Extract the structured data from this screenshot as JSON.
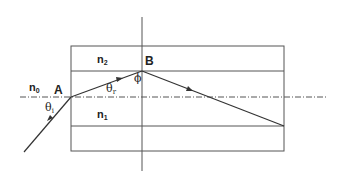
{
  "diagram": {
    "colors": {
      "line": "#555555",
      "ray": "#333333",
      "background": "#ffffff"
    },
    "labels": {
      "n0": {
        "base": "n",
        "sub": "0"
      },
      "n1": {
        "base": "n",
        "sub": "1"
      },
      "n2": {
        "base": "n",
        "sub": "2"
      },
      "pointA": "A",
      "pointB": "B",
      "theta_i": {
        "base": "θ",
        "sub": "i"
      },
      "theta_r": {
        "base": "θ",
        "sub": "r"
      },
      "phi": "ϕ"
    },
    "layers": [
      {
        "name": "upper cladding",
        "index": "n2"
      },
      {
        "name": "core",
        "index": "n1"
      },
      {
        "name": "lower cladding",
        "index": "n2"
      }
    ],
    "ray_path": [
      {
        "from": "source",
        "to": "A",
        "description": "incident ray at angle θi"
      },
      {
        "from": "A",
        "to": "B",
        "description": "refracted ray at angle θr"
      },
      {
        "from": "B",
        "to": "core-cladding interface",
        "description": "reflected ray at angle ϕ"
      }
    ]
  }
}
